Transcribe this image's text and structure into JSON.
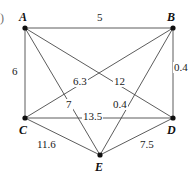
{
  "figure": {
    "item_marker": ")",
    "width": 195,
    "height": 176,
    "line_color": "#4a4a4a",
    "vertex_color": "#101010",
    "text_color": "#1a1a1a"
  },
  "chart_data": {
    "type": "diagram",
    "title": "",
    "graph_kind": "weighted complete graph K5",
    "nodes": [
      {
        "id": "A",
        "label": "A",
        "x": 25,
        "y": 28
      },
      {
        "id": "B",
        "label": "B",
        "x": 173,
        "y": 28
      },
      {
        "id": "C",
        "label": "C",
        "x": 25,
        "y": 118
      },
      {
        "id": "D",
        "label": "D",
        "x": 173,
        "y": 118
      },
      {
        "id": "E",
        "label": "E",
        "x": 100,
        "y": 155
      }
    ],
    "edges": [
      {
        "from": "A",
        "to": "B",
        "weight": "5",
        "label_x": 96,
        "label_y": 12
      },
      {
        "from": "A",
        "to": "C",
        "weight": "6",
        "label_x": 11,
        "label_y": 66
      },
      {
        "from": "A",
        "to": "D",
        "weight": "6.3",
        "label_x": 72,
        "label_y": 76
      },
      {
        "from": "A",
        "to": "E",
        "weight": "7",
        "label_x": 65,
        "label_y": 99
      },
      {
        "from": "B",
        "to": "C",
        "weight": "12",
        "label_x": 113,
        "label_y": 76
      },
      {
        "from": "B",
        "to": "D",
        "weight": "0.4",
        "label_x": 173,
        "label_y": 62
      },
      {
        "from": "B",
        "to": "E",
        "weight": "0.4",
        "label_x": 112,
        "label_y": 99
      },
      {
        "from": "C",
        "to": "D",
        "weight": "13.5",
        "label_x": 82,
        "label_y": 111
      },
      {
        "from": "C",
        "to": "E",
        "weight": "11.6",
        "label_x": 36,
        "label_y": 139
      },
      {
        "from": "D",
        "to": "E",
        "weight": "7.5",
        "label_x": 139,
        "label_y": 139
      }
    ],
    "vertex_label_positions": [
      {
        "id": "A",
        "x": 19,
        "y": 11
      },
      {
        "id": "B",
        "x": 167,
        "y": 11
      },
      {
        "id": "C",
        "x": 19,
        "y": 124
      },
      {
        "id": "D",
        "x": 167,
        "y": 124
      },
      {
        "id": "E",
        "x": 95,
        "y": 161
      }
    ]
  }
}
